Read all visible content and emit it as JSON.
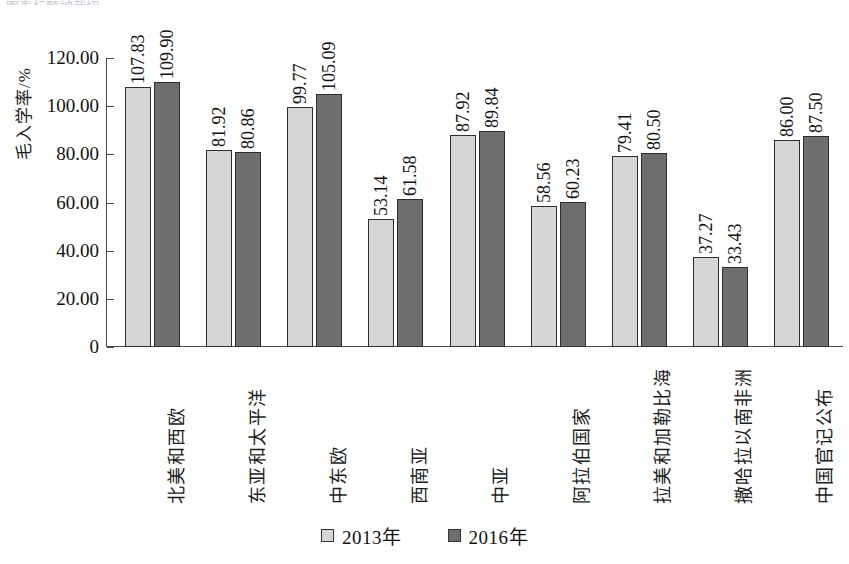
{
  "figure": {
    "top_clipped_caption": "图表标题被裁切",
    "background": "#ffffff"
  },
  "legend": {
    "position": "bottom-center",
    "items": [
      {
        "label": "2013年",
        "color": "#d6d6d6",
        "swatch": "legend-swatch-2013"
      },
      {
        "label": "2016年",
        "color": "#6e6e6e",
        "swatch": "legend-swatch-2016"
      }
    ]
  },
  "chart_data": {
    "type": "bar",
    "title": "",
    "xlabel": "",
    "ylabel": "毛入学率/%",
    "ylim": [
      0,
      120
    ],
    "ytick_labels": [
      "0",
      "20.00",
      "40.00",
      "60.00",
      "80.00",
      "100.00",
      "120.00"
    ],
    "ytick_values": [
      0,
      20,
      40,
      60,
      80,
      100,
      120
    ],
    "grid": false,
    "legend_position": "bottom",
    "categories": [
      "北美和西欧",
      "东亚和太平洋",
      "中东欧",
      "西南亚",
      "中亚",
      "阿拉伯国家",
      "拉美和加勒比海",
      "撒哈拉以南非洲",
      "中国官记公布"
    ],
    "series": [
      {
        "name": "2013年",
        "color": "#d6d6d6",
        "values": [
          107.83,
          81.92,
          99.77,
          53.14,
          87.92,
          58.56,
          79.41,
          37.27,
          86.0
        ],
        "labels": [
          "107.83",
          "81.92",
          "99.77",
          "53.14",
          "87.92",
          "58.56",
          "79.41",
          "37.27",
          "86.00"
        ]
      },
      {
        "name": "2016年",
        "color": "#6e6e6e",
        "values": [
          109.9,
          80.86,
          105.09,
          61.58,
          89.84,
          60.23,
          80.5,
          33.43,
          87.5
        ],
        "labels": [
          "109.90",
          "80.86",
          "105.09",
          "61.58",
          "89.84",
          "60.23",
          "80.50",
          "33.43",
          "87.50"
        ]
      }
    ]
  }
}
